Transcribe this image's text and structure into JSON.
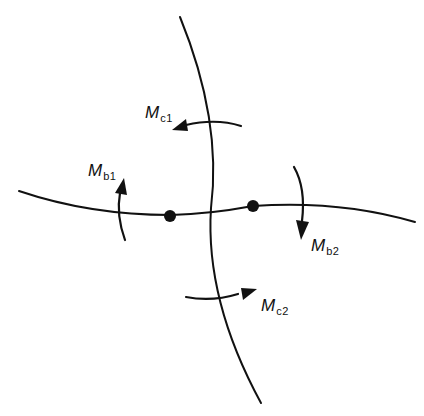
{
  "diagram": {
    "type": "structural joint moment diagram",
    "colors": {
      "line": "#111111",
      "background": "#ffffff"
    },
    "members": [
      {
        "id": "column",
        "orientation": "vertical",
        "description": "curved vertical member"
      },
      {
        "id": "beam",
        "orientation": "horizontal",
        "description": "curved horizontal member"
      }
    ],
    "nodes": [
      {
        "id": "node-left"
      },
      {
        "id": "node-right"
      }
    ],
    "moments": [
      {
        "id": "Mc1",
        "symbol": "M",
        "subscript": "c1",
        "direction": "counterclockwise arrow pointing left, above joint"
      },
      {
        "id": "Mb1",
        "symbol": "M",
        "subscript": "b1",
        "direction": "arrow pointing up, left of joint"
      },
      {
        "id": "Mb2",
        "symbol": "M",
        "subscript": "b2",
        "direction": "arrow pointing down, right of joint"
      },
      {
        "id": "Mc2",
        "symbol": "M",
        "subscript": "c2",
        "direction": "arrow pointing right, below joint"
      }
    ]
  }
}
